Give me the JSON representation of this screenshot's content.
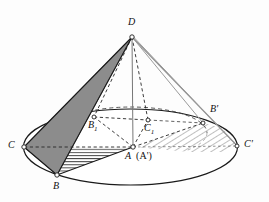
{
  "figure": {
    "type": "geometry-diagram",
    "width": 269,
    "height": 202,
    "background_color": "#fdfdfd",
    "stroke_color": "#1a1a1a",
    "shaded_face_color": "#8c8c8c",
    "hatch_color": "#5a5a5a",
    "light_hatch_color": "#a8a8a8"
  },
  "points": [
    {
      "id": "D",
      "label": "D",
      "x": 132.0,
      "y": 37.0,
      "label_x": 129,
      "label_y": 19,
      "vertex_marker": true
    },
    {
      "id": "C",
      "label": "C",
      "x": 24.0,
      "y": 147.0,
      "label_x": 10,
      "label_y": 142,
      "vertex_marker": true
    },
    {
      "id": "B",
      "label": "B",
      "x": 57.0,
      "y": 175.0,
      "label_x": 53,
      "label_y": 182,
      "vertex_marker": true
    },
    {
      "id": "A",
      "label": "A",
      "x": 133.0,
      "y": 147.0,
      "label_x": 125,
      "label_y": 152,
      "vertex_marker": true
    },
    {
      "id": "B1",
      "label": "B",
      "sub": "1",
      "x": 94.0,
      "y": 117.0,
      "label_x": 89,
      "label_y": 121,
      "vertex_marker": true
    },
    {
      "id": "C1",
      "label": "C",
      "sub": "1",
      "x": 148.0,
      "y": 120.0,
      "label_x": 145,
      "label_y": 124,
      "vertex_marker": true
    },
    {
      "id": "Bp",
      "label": "B'",
      "x": 203.0,
      "y": 123.0,
      "label_x": 210,
      "label_y": 107,
      "vertex_marker": true
    },
    {
      "id": "Cp",
      "label": "C'",
      "x": 237.0,
      "y": 146.0,
      "label_x": 244,
      "label_y": 141,
      "vertex_marker": true
    }
  ],
  "labels": {
    "apex": "D",
    "base_left": "C",
    "base_bottom": "B",
    "base_center_front": "A",
    "base_center_front_alias": "(A')",
    "mid_left": "B",
    "mid_left_sub": "1",
    "mid_right": "C",
    "mid_right_sub": "1",
    "rotated_b": "B'",
    "rotated_c": "C'"
  },
  "base_ellipse": {
    "center_x": 130.5,
    "center_y": 147.0,
    "rx": 107.0,
    "ry": 38.0,
    "stroke": "#1a1a1a"
  },
  "inner_ellipse": {
    "center_x": 131.0,
    "center_y": 133.0,
    "rx": 76.0,
    "ry": 26.0,
    "stroke": "#333333",
    "dashed": true
  },
  "shaded_face": {
    "name": "triangle-DCB",
    "vertices": "D,C,B",
    "fill": "#8c8c8c"
  },
  "hatched_regions": [
    {
      "name": "triangle-ABC-horizontal-hatch",
      "vertices": "A,B,C",
      "pattern": "horizontal",
      "color": "#3a3a3a"
    },
    {
      "name": "region-A-Bprime-Cprime-diagonal-hatch",
      "vertices": "A,B',C'",
      "pattern": "diagonal",
      "color": "#a8a8a8"
    }
  ],
  "edges": [
    {
      "from": "D",
      "to": "C",
      "style": "solid",
      "name": "edge-DC"
    },
    {
      "from": "D",
      "to": "B",
      "style": "solid",
      "name": "edge-DB"
    },
    {
      "from": "D",
      "to": "A",
      "style": "solid",
      "name": "edge-DA-axis"
    },
    {
      "from": "D",
      "to": "B1",
      "style": "dashed",
      "name": "edge-DB1"
    },
    {
      "from": "D",
      "to": "C1",
      "style": "dashed",
      "name": "edge-DC1"
    },
    {
      "from": "D",
      "to": "Bp",
      "style": "solid",
      "name": "edge-DBprime"
    },
    {
      "from": "D",
      "to": "Cp",
      "style": "solid",
      "name": "edge-DCprime"
    },
    {
      "from": "C",
      "to": "A",
      "style": "dashed",
      "name": "edge-CA"
    },
    {
      "from": "C",
      "to": "B",
      "style": "solid",
      "name": "edge-CB"
    },
    {
      "from": "B",
      "to": "A",
      "style": "solid",
      "name": "edge-BA"
    },
    {
      "from": "A",
      "to": "B1",
      "style": "dashed",
      "name": "edge-AB1"
    },
    {
      "from": "A",
      "to": "C1",
      "style": "dashed",
      "name": "edge-AC1"
    },
    {
      "from": "B1",
      "to": "C1",
      "style": "dashed",
      "name": "edge-B1C1"
    },
    {
      "from": "A",
      "to": "Bp",
      "style": "dashed",
      "name": "edge-ABprime"
    },
    {
      "from": "A",
      "to": "Cp",
      "style": "dashed",
      "name": "edge-ACprime"
    }
  ]
}
